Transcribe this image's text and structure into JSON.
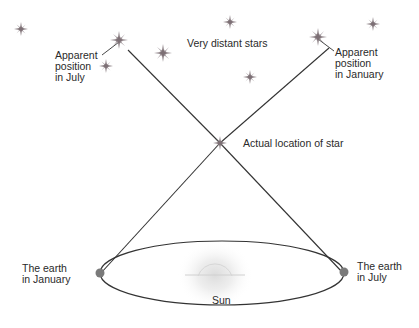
{
  "diagram": {
    "labels": {
      "apparent_july": "Apparent\nposition\nin July",
      "very_distant_stars": "Very distant stars",
      "apparent_january": "Apparent\nposition\nin January",
      "actual_location": "Actual location of star",
      "earth_january": "The earth\nin January",
      "earth_july": "The earth\nin July",
      "sun": "Sun"
    },
    "colors": {
      "line": "#333333",
      "star": "#8a7d82",
      "earth": "#7a7a7a",
      "sun_glow": "#bdbdbd",
      "text": "#2a2a2a"
    }
  }
}
